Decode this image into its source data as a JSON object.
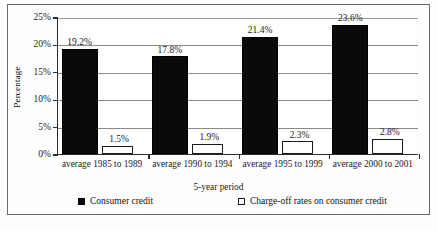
{
  "chart_data": {
    "type": "bar",
    "title": "",
    "xlabel": "5-year period",
    "ylabel": "Percentage",
    "categories": [
      "average 1985 to 1989",
      "average 1990 to 1994",
      "average 1995 to 1999",
      "average 2000 to 2001"
    ],
    "series": [
      {
        "name": "Consumer credit",
        "color": "#0a0a0a",
        "style": "filled",
        "values": [
          19.2,
          17.8,
          21.4,
          23.6
        ],
        "labels": [
          "19.2%",
          "17.8%",
          "21.4%",
          "23.6%"
        ]
      },
      {
        "name": "Charge-off rates on consumer credit",
        "color": "#ffffff",
        "style": "hollow",
        "values": [
          1.5,
          1.9,
          2.3,
          2.8
        ],
        "labels": [
          "1.5%",
          "1.9%",
          "2.3%",
          "2.8%"
        ]
      }
    ],
    "ylim": [
      0,
      25
    ],
    "yticks": [
      0,
      5,
      10,
      15,
      20,
      25
    ],
    "ytick_labels": [
      "0%",
      "5%",
      "10%",
      "15%",
      "20%",
      "25%"
    ],
    "grid": true,
    "grid_axis": "y",
    "legend_position": "bottom"
  },
  "legend": {
    "items": [
      {
        "label": "Consumer credit",
        "swatch": "filled-square-icon"
      },
      {
        "label": "Charge-off rates on consumer credit",
        "swatch": "hollow-square-icon"
      }
    ]
  }
}
